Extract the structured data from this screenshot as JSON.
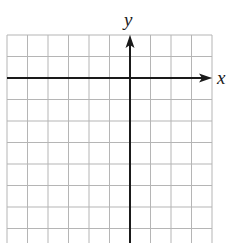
{
  "diagram": {
    "type": "coordinate-grid",
    "axes": {
      "x_label": "x",
      "y_label": "y",
      "x_arrow": "right",
      "y_arrow": "up"
    },
    "grid": {
      "columns": 10,
      "rows_visible": 10,
      "origin_column_index": 6,
      "origin_row_index": 2,
      "left": 7,
      "top": 35,
      "right": 212,
      "bottom": 243,
      "cell_width": 20.5,
      "cell_height": 21.5
    },
    "colors": {
      "background": "#ffffff",
      "grid_line": "#b5b5b5",
      "axis_line": "#1a1a1a"
    }
  }
}
